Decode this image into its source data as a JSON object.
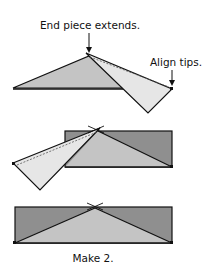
{
  "labels": {
    "end_piece": "End piece extends.",
    "align_tips": "Align tips.",
    "make": "Make 2."
  },
  "colors": {
    "background": "#ffffff",
    "dark_fabric": "#8f8f8f",
    "medium_fabric": "#c4c4c4",
    "light_fabric": "#e6e6e6",
    "outline": "#111111"
  },
  "steps": [
    {
      "id": "step-1",
      "description": "End piece extends past apex; align tips"
    },
    {
      "id": "step-2",
      "description": "Second end piece sewn to opposite side"
    },
    {
      "id": "step-3",
      "description": "Finished flying-geese style unit"
    }
  ]
}
